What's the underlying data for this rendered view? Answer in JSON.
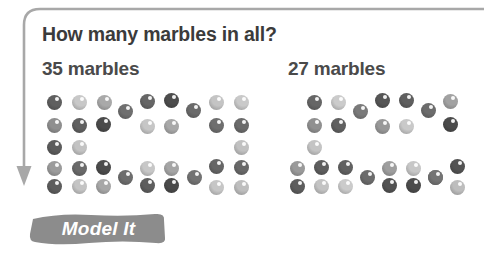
{
  "page": {
    "background_color": "#ffffff",
    "text_color": "#3b3b3b"
  },
  "arrow": {
    "name": "flow-arrow",
    "color": "#a6a6a6",
    "description": "rounded elbow arrow running across the top edge, turning down the left margin, ending in a downward arrowhead"
  },
  "question": {
    "text": "How many marbles in all?"
  },
  "groups": [
    {
      "id": "left-group",
      "label": "35 marbles",
      "count": 35
    },
    {
      "id": "right-group",
      "label": "27 marbles",
      "count": 27
    }
  ],
  "badge": {
    "label": "Model It",
    "fill_color": "#8c8c8c",
    "text_color": "#ffffff"
  },
  "marble_palette": {
    "dark": "#5a5a5a",
    "mid": "#7d7d7d",
    "light": "#b4b4b4",
    "pale": "#cfcfcf",
    "darkest": "#4a4a4a"
  },
  "marbles": {
    "left": [
      {
        "x": 47,
        "y": 95,
        "c": "#5f5f5f"
      },
      {
        "x": 72,
        "y": 95,
        "c": "#c8c8c8"
      },
      {
        "x": 97,
        "y": 95,
        "c": "#a9a9a9"
      },
      {
        "x": 118,
        "y": 104,
        "c": "#6f6f6f"
      },
      {
        "x": 140,
        "y": 94,
        "c": "#666666"
      },
      {
        "x": 164,
        "y": 93,
        "c": "#4d4d4d"
      },
      {
        "x": 186,
        "y": 103,
        "c": "#6a6a6a"
      },
      {
        "x": 209,
        "y": 95,
        "c": "#c4c4c4"
      },
      {
        "x": 234,
        "y": 95,
        "c": "#c9c9c9"
      },
      {
        "x": 47,
        "y": 118,
        "c": "#8f8f8f"
      },
      {
        "x": 72,
        "y": 118,
        "c": "#606060"
      },
      {
        "x": 96,
        "y": 117,
        "c": "#4b4b4b"
      },
      {
        "x": 140,
        "y": 119,
        "c": "#c6c6c6"
      },
      {
        "x": 164,
        "y": 119,
        "c": "#a8a8a8"
      },
      {
        "x": 209,
        "y": 118,
        "c": "#6e6e6e"
      },
      {
        "x": 234,
        "y": 118,
        "c": "#6b6b6b"
      },
      {
        "x": 47,
        "y": 140,
        "c": "#5c5c5c"
      },
      {
        "x": 72,
        "y": 140,
        "c": "#c3c3c3"
      },
      {
        "x": 234,
        "y": 140,
        "c": "#c1c1c1"
      },
      {
        "x": 47,
        "y": 161,
        "c": "#9b9b9b"
      },
      {
        "x": 72,
        "y": 161,
        "c": "#6a6a6a"
      },
      {
        "x": 96,
        "y": 160,
        "c": "#4c4c4c"
      },
      {
        "x": 118,
        "y": 170,
        "c": "#6d6d6d"
      },
      {
        "x": 140,
        "y": 161,
        "c": "#c7c7c7"
      },
      {
        "x": 164,
        "y": 161,
        "c": "#a5a5a5"
      },
      {
        "x": 187,
        "y": 170,
        "c": "#737373"
      },
      {
        "x": 209,
        "y": 159,
        "c": "#666666"
      },
      {
        "x": 234,
        "y": 160,
        "c": "#696969"
      },
      {
        "x": 47,
        "y": 179,
        "c": "#5d5d5d"
      },
      {
        "x": 72,
        "y": 179,
        "c": "#c4c4c4"
      },
      {
        "x": 96,
        "y": 179,
        "c": "#a7a7a7"
      },
      {
        "x": 140,
        "y": 178,
        "c": "#5e5e5e"
      },
      {
        "x": 164,
        "y": 178,
        "c": "#4a4a4a"
      },
      {
        "x": 209,
        "y": 180,
        "c": "#c6c6c6"
      },
      {
        "x": 234,
        "y": 180,
        "c": "#bebebe"
      }
    ],
    "right": [
      {
        "x": 307,
        "y": 95,
        "c": "#666666"
      },
      {
        "x": 331,
        "y": 95,
        "c": "#cbcbcb"
      },
      {
        "x": 353,
        "y": 104,
        "c": "#7a7a7a"
      },
      {
        "x": 375,
        "y": 93,
        "c": "#565656"
      },
      {
        "x": 399,
        "y": 93,
        "c": "#5f5f5f"
      },
      {
        "x": 421,
        "y": 103,
        "c": "#6c6c6c"
      },
      {
        "x": 443,
        "y": 94,
        "c": "#a2a2a2"
      },
      {
        "x": 307,
        "y": 118,
        "c": "#909090"
      },
      {
        "x": 331,
        "y": 118,
        "c": "#606060"
      },
      {
        "x": 375,
        "y": 119,
        "c": "#989898"
      },
      {
        "x": 399,
        "y": 119,
        "c": "#c9c9c9"
      },
      {
        "x": 443,
        "y": 117,
        "c": "#4b4b4b"
      },
      {
        "x": 307,
        "y": 140,
        "c": "#c4c4c4"
      },
      {
        "x": 290,
        "y": 161,
        "c": "#9a9a9a"
      },
      {
        "x": 314,
        "y": 160,
        "c": "#5e5e5e"
      },
      {
        "x": 338,
        "y": 160,
        "c": "#616161"
      },
      {
        "x": 360,
        "y": 170,
        "c": "#6b6b6b"
      },
      {
        "x": 382,
        "y": 161,
        "c": "#9e9e9e"
      },
      {
        "x": 406,
        "y": 161,
        "c": "#c7c7c7"
      },
      {
        "x": 428,
        "y": 170,
        "c": "#737373"
      },
      {
        "x": 450,
        "y": 159,
        "c": "#535353"
      },
      {
        "x": 290,
        "y": 179,
        "c": "#5d5d5d"
      },
      {
        "x": 314,
        "y": 179,
        "c": "#c3c3c3"
      },
      {
        "x": 338,
        "y": 179,
        "c": "#cbcbcb"
      },
      {
        "x": 382,
        "y": 178,
        "c": "#525252"
      },
      {
        "x": 406,
        "y": 178,
        "c": "#4c4c4c"
      },
      {
        "x": 428,
        "y": 170,
        "c": "#747474"
      },
      {
        "x": 450,
        "y": 180,
        "c": "#bdbdbd"
      }
    ]
  }
}
